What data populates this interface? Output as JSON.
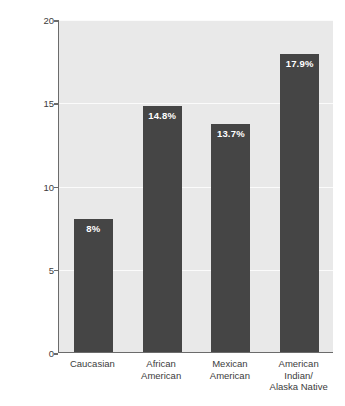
{
  "chart_data": {
    "type": "bar",
    "title": "",
    "xlabel": "",
    "ylabel": "Percent (%) of adults with type 2 diabetes",
    "ylim": [
      0,
      20
    ],
    "yticks": [
      0,
      5,
      10,
      15,
      20
    ],
    "ytick_labels": [
      "0",
      "5",
      "10",
      "15",
      "20"
    ],
    "grid": true,
    "legend": false,
    "categories": [
      "Caucasian",
      "African American",
      "Mexican American",
      "American Indian/ Alaska Native"
    ],
    "category_lines": [
      [
        "Caucasian"
      ],
      [
        "African",
        "American"
      ],
      [
        "Mexican",
        "American"
      ],
      [
        "American",
        "Indian/",
        "Alaska Native"
      ]
    ],
    "values": [
      8,
      14.8,
      13.7,
      17.9
    ],
    "data_labels": [
      "8%",
      "14.8%",
      "13.7%",
      "17.9%"
    ],
    "colors": {
      "bar": "#454545",
      "plot_background": "#e9e9e9",
      "gridline": "#fbfbfb",
      "axis": "#6b6b6b",
      "text": "#3c3c3c",
      "data_label_text": "#ffffff",
      "page_background": "#ffffff"
    }
  }
}
